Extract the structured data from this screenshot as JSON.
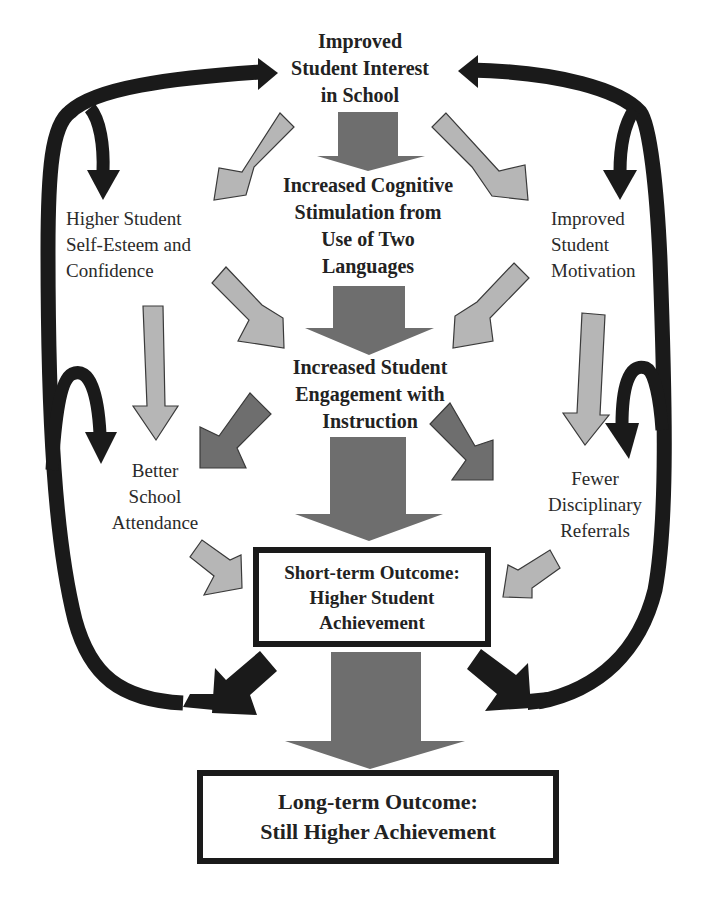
{
  "diagram": {
    "title_node": {
      "lines": [
        "Improved",
        "Student Interest",
        "in School"
      ]
    },
    "cognitive_node": {
      "lines": [
        "Increased Cognitive",
        "Stimulation from",
        "Use of Two",
        "Languages"
      ]
    },
    "engagement_node": {
      "lines": [
        "Increased Student",
        "Engagement with",
        "Instruction"
      ]
    },
    "self_esteem_node": {
      "lines": [
        "Higher Student",
        "Self-Esteem and",
        "Confidence"
      ]
    },
    "motivation_node": {
      "lines": [
        "Improved",
        "Student",
        "Motivation"
      ]
    },
    "attendance_node": {
      "lines": [
        "Better",
        "School",
        "Attendance"
      ]
    },
    "referrals_node": {
      "lines": [
        "Fewer",
        "Disciplinary",
        "Referrals"
      ]
    },
    "short_term_box": {
      "lines": [
        "Short-term Outcome:",
        "Higher Student",
        "Achievement"
      ]
    },
    "long_term_box": {
      "lines": [
        "Long-term Outcome:",
        "Still Higher Achievement"
      ]
    },
    "colors": {
      "feedback_arrow": "#1a1a1a",
      "main_flow_arrow": "#6e6e6e",
      "engagement_arrow": "#6e6e6e",
      "secondary_arrow": "#b4b4b4",
      "arrow_outline": "#3a3a3a",
      "box_border": "#1a1a1a",
      "text": "#222222"
    },
    "edges": [
      {
        "from": "Improved Student Interest in School",
        "to": "Increased Cognitive Stimulation from Use of Two Languages",
        "style": "main"
      },
      {
        "from": "Improved Student Interest in School",
        "to": "Higher Student Self-Esteem and Confidence",
        "style": "secondary"
      },
      {
        "from": "Improved Student Interest in School",
        "to": "Improved Student Motivation",
        "style": "secondary"
      },
      {
        "from": "Increased Cognitive Stimulation from Use of Two Languages",
        "to": "Increased Student Engagement with Instruction",
        "style": "main"
      },
      {
        "from": "Higher Student Self-Esteem and Confidence",
        "to": "Increased Student Engagement with Instruction",
        "style": "secondary"
      },
      {
        "from": "Improved Student Motivation",
        "to": "Increased Student Engagement with Instruction",
        "style": "secondary"
      },
      {
        "from": "Higher Student Self-Esteem and Confidence",
        "to": "Better School Attendance",
        "style": "secondary"
      },
      {
        "from": "Improved Student Motivation",
        "to": "Fewer Disciplinary Referrals",
        "style": "secondary"
      },
      {
        "from": "Increased Student Engagement with Instruction",
        "to": "Better School Attendance",
        "style": "main"
      },
      {
        "from": "Increased Student Engagement with Instruction",
        "to": "Fewer Disciplinary Referrals",
        "style": "main"
      },
      {
        "from": "Increased Student Engagement with Instruction",
        "to": "Short-term Outcome: Higher Student Achievement",
        "style": "main"
      },
      {
        "from": "Better School Attendance",
        "to": "Short-term Outcome: Higher Student Achievement",
        "style": "secondary"
      },
      {
        "from": "Fewer Disciplinary Referrals",
        "to": "Short-term Outcome: Higher Student Achievement",
        "style": "secondary"
      },
      {
        "from": "Short-term Outcome: Higher Student Achievement",
        "to": "Long-term Outcome: Still Higher Achievement",
        "style": "main"
      },
      {
        "from": "Short-term Outcome: Higher Student Achievement",
        "to": "Improved Student Interest in School",
        "style": "feedback"
      },
      {
        "from": "Short-term Outcome: Higher Student Achievement",
        "to": "Higher Student Self-Esteem and Confidence",
        "style": "feedback"
      },
      {
        "from": "Short-term Outcome: Higher Student Achievement",
        "to": "Better School Attendance",
        "style": "feedback"
      },
      {
        "from": "Short-term Outcome: Higher Student Achievement",
        "to": "Improved Student Motivation",
        "style": "feedback"
      },
      {
        "from": "Short-term Outcome: Higher Student Achievement",
        "to": "Fewer Disciplinary Referrals",
        "style": "feedback"
      }
    ]
  }
}
